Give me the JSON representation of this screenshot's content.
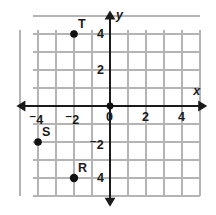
{
  "figure": {
    "type": "coordinate-plane",
    "title": "",
    "background_color": "#ffffff",
    "grid_color": "#b4b4b4",
    "axis_color": "#1a1a1a",
    "point_color": "#111111",
    "origin_px": {
      "x": 110,
      "y": 106
    },
    "unit_px": 18,
    "grid": {
      "visible": true,
      "x_lines": [
        -5,
        -4,
        -3,
        -2,
        -1,
        0,
        1,
        2,
        3,
        4,
        5
      ],
      "y_lines": [
        5,
        4,
        3,
        2,
        1,
        0,
        -1,
        -2,
        -3,
        -4,
        -5
      ],
      "x_extent": [
        -4.3,
        5.0
      ],
      "y_extent": [
        4.2,
        -5.0
      ]
    },
    "axes": {
      "x": {
        "name": "x",
        "name_position": "upper-right",
        "arrows": "both",
        "range": [
          -5.2,
          5.4
        ],
        "tick_labels": [
          {
            "value": -4,
            "text": "4",
            "negative": true
          },
          {
            "value": -2,
            "text": "2",
            "negative": true
          },
          {
            "value": 0,
            "text": "0",
            "negative": false
          },
          {
            "value": 2,
            "text": "2",
            "negative": false
          },
          {
            "value": 4,
            "text": "4",
            "negative": false
          }
        ]
      },
      "y": {
        "name": "y",
        "name_position": "upper-right",
        "arrows": "both",
        "range": [
          5.3,
          -5.6
        ],
        "tick_labels": [
          {
            "value": 4,
            "text": "4",
            "negative": false
          },
          {
            "value": 2,
            "text": "2",
            "negative": false
          },
          {
            "value": -2,
            "text": "2",
            "negative": true
          },
          {
            "value": -4,
            "text": "4",
            "negative": false
          }
        ]
      }
    },
    "origin_marker": {
      "visible": true,
      "radius": 3.4
    },
    "points": [
      {
        "label": "T",
        "x": -2,
        "y": 4,
        "radius": 3.8,
        "label_dx": 6,
        "label_dy": -16
      },
      {
        "label": "S",
        "x": -4,
        "y": -2,
        "radius": 3.8,
        "label_dx": 6,
        "label_dy": -16
      },
      {
        "label": "R",
        "x": -2,
        "y": -4,
        "radius": 4.2,
        "label_dx": 6,
        "label_dy": -16
      }
    ]
  }
}
